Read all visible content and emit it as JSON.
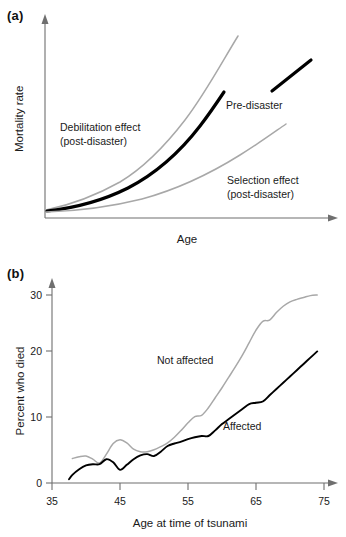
{
  "figure": {
    "panels": [
      {
        "tag": "(a)",
        "xlabel": "Age",
        "ylabel": "Mortality rate",
        "annotations": [
          {
            "name": "debilitation",
            "line1": "Debilitation effect",
            "line2": "(post-disaster)"
          },
          {
            "name": "pre-disaster",
            "line1": "Pre-disaster",
            "line2": ""
          },
          {
            "name": "selection",
            "line1": "Selection effect",
            "line2": "(post-disaster)"
          }
        ]
      },
      {
        "tag": "(b)",
        "xlabel": "Age at time of tsunami",
        "ylabel": "Percent who died",
        "annotations": [
          {
            "name": "not-affected",
            "line1": "Not affected",
            "line2": ""
          },
          {
            "name": "affected",
            "line1": "Affected",
            "line2": ""
          }
        ]
      }
    ]
  },
  "colors": {
    "gray_series": "#a8a8a8",
    "black_series": "#000000",
    "axis": "#6f6f6f",
    "text": "#1a1a1a",
    "background": "#ffffff"
  },
  "chart_data": [
    {
      "id": "panel-a",
      "type": "line",
      "title": "(a)",
      "xlabel": "Age",
      "ylabel": "Mortality rate",
      "grid": false,
      "legend": "inline-annotations",
      "axis_ticks": {
        "x": [],
        "y": []
      },
      "xlim": [
        0,
        100
      ],
      "ylim": [
        0,
        100
      ],
      "note": "Schematic curves, axes unlabeled with numbers; values are relative/illustrative.",
      "series": [
        {
          "name": "Debilitation effect (post-disaster)",
          "color": "#a8a8a8",
          "style": "thin-gray",
          "x": [
            0,
            10,
            20,
            30,
            40,
            50,
            60,
            70,
            80,
            88
          ],
          "y": [
            4,
            6,
            9,
            14,
            21,
            31,
            44,
            60,
            80,
            95
          ]
        },
        {
          "name": "Pre-disaster",
          "color": "#000000",
          "style": "thick-black",
          "x": [
            0,
            10,
            20,
            30,
            40,
            50,
            60,
            70,
            78
          ],
          "y": [
            4,
            5.5,
            8,
            11,
            16,
            23,
            33,
            46,
            57
          ]
        },
        {
          "name": "Pre-disaster (label leader segment)",
          "color": "#000000",
          "style": "thick-black-segment",
          "x": [
            80,
            96
          ],
          "y": [
            66,
            82
          ]
        },
        {
          "name": "Selection effect (post-disaster)",
          "color": "#a8a8a8",
          "style": "thin-gray",
          "x": [
            0,
            10,
            20,
            30,
            40,
            50,
            60,
            70,
            80,
            92
          ],
          "y": [
            4,
            4.6,
            5.6,
            7,
            9,
            12,
            17,
            24,
            33,
            47
          ]
        }
      ]
    },
    {
      "id": "panel-b",
      "type": "line",
      "title": "(b)",
      "xlabel": "Age at time of tsunami",
      "ylabel": "Percent who died",
      "grid": false,
      "legend": "inline-annotations",
      "xlim": [
        35,
        77
      ],
      "ylim": [
        0,
        32
      ],
      "axis_ticks": {
        "x": [
          35,
          45,
          55,
          65,
          75
        ],
        "y": [
          0,
          10,
          20,
          30
        ]
      },
      "series": [
        {
          "name": "Not affected",
          "color": "#a8a8a8",
          "style": "thin-gray",
          "x": [
            38,
            39,
            40,
            41,
            42,
            43,
            44,
            45,
            46,
            47,
            48,
            49,
            50,
            51,
            52,
            53,
            54,
            55,
            56,
            57,
            58,
            59,
            60,
            61,
            62,
            63,
            64,
            65,
            66,
            67,
            68,
            69,
            70,
            71,
            72,
            73,
            74
          ],
          "y": [
            3.9,
            4.2,
            4.3,
            3.8,
            3.2,
            4.6,
            6.3,
            6.9,
            6.4,
            5.4,
            5.0,
            5.0,
            5.3,
            5.8,
            6.4,
            7.3,
            8.4,
            9.6,
            10.6,
            10.8,
            12.0,
            13.6,
            15.2,
            16.9,
            18.6,
            20.4,
            22.4,
            24.4,
            25.8,
            26.0,
            27.2,
            28.2,
            28.9,
            29.3,
            29.6,
            29.9,
            30.0
          ]
        },
        {
          "name": "Affected",
          "color": "#000000",
          "style": "black",
          "x": [
            37.5,
            38,
            39,
            40,
            41,
            42,
            43,
            44,
            45,
            46,
            47,
            48,
            49,
            50,
            51,
            52,
            53,
            54,
            55,
            56,
            57,
            58,
            59,
            60,
            61,
            62,
            63,
            64,
            65,
            66,
            67,
            68,
            69,
            70,
            71,
            72,
            73,
            74
          ],
          "y": [
            0.6,
            1.3,
            2.2,
            2.8,
            3.0,
            3.0,
            3.8,
            3.3,
            2.1,
            2.9,
            3.8,
            4.4,
            4.6,
            4.3,
            5.0,
            5.9,
            6.3,
            6.6,
            7.0,
            7.3,
            7.5,
            7.5,
            8.4,
            9.4,
            10.2,
            11.0,
            11.8,
            12.6,
            12.8,
            13.0,
            14.0,
            15.0,
            16.0,
            17.0,
            18.0,
            19.0,
            20.0,
            21.0
          ]
        }
      ]
    }
  ]
}
